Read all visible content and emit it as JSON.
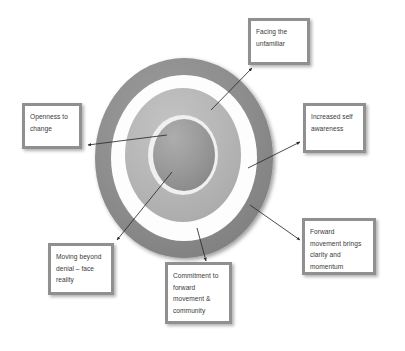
{
  "diagram": {
    "type": "concentric-rings-callout",
    "rings": [
      {
        "name": "outer-ring",
        "color": "#8f8f8f",
        "label_source": "facing-the-unfamiliar"
      },
      {
        "name": "white-gap",
        "color": "#ffffff"
      },
      {
        "name": "middle-ring",
        "color": "#b6b6b6"
      },
      {
        "name": "inner-gap",
        "color": "#f2f2f2"
      },
      {
        "name": "core-circle",
        "color": "#9a9a9a"
      }
    ],
    "colors": {
      "outer_ring": "#8f8f8f",
      "middle_ring": "#b6b6b6",
      "core_circle": "#9a9a9a",
      "box_border": "#909090",
      "box_fill": "#ffffff",
      "arrow": "#2b2b2b",
      "text": "#3a3a3a",
      "background": "#ffffff"
    }
  },
  "callouts": [
    {
      "id": "facing",
      "name": "facing-the-unfamiliar",
      "lines": [
        "Facing the",
        "unfamiliar"
      ],
      "position": "top-right"
    },
    {
      "id": "openness",
      "name": "openness-to-change",
      "lines": [
        "Openness to",
        "change"
      ],
      "position": "left"
    },
    {
      "id": "awareness",
      "name": "increased-self-awareness",
      "lines": [
        "Increased self",
        "awareness"
      ],
      "position": "right"
    },
    {
      "id": "forward",
      "name": "forward-movement-brings-clarity-and-momentum",
      "lines": [
        "Forward",
        "movement brings",
        "clarity and",
        "momentum"
      ],
      "position": "bottom-right"
    },
    {
      "id": "moving",
      "name": "moving-beyond-denial-face-reality",
      "lines": [
        "Moving beyond",
        "denial – face",
        "reality"
      ],
      "position": "bottom-left"
    },
    {
      "id": "commitment",
      "name": "commitment-to-forward-movement-and-community",
      "lines": [
        "Commitment to",
        "forward",
        "movement &",
        "community"
      ],
      "position": "bottom-center"
    }
  ],
  "arrows": [
    {
      "name": "arrow-to-facing",
      "from": "middle-ring",
      "to": "facing",
      "direction": "up-right"
    },
    {
      "name": "arrow-to-openness",
      "from": "middle-ring",
      "to": "openness",
      "direction": "left"
    },
    {
      "name": "arrow-to-awareness",
      "from": "white-gap",
      "to": "awareness",
      "direction": "up-right"
    },
    {
      "name": "arrow-to-forward",
      "from": "outer-ring",
      "to": "forward",
      "direction": "down-right"
    },
    {
      "name": "arrow-to-moving",
      "from": "core-circle",
      "to": "moving",
      "direction": "down-left"
    },
    {
      "name": "arrow-to-commitment",
      "from": "middle-ring",
      "to": "commitment",
      "direction": "down"
    }
  ]
}
